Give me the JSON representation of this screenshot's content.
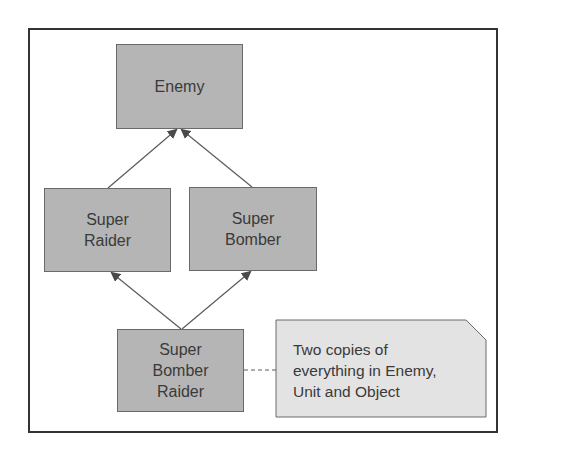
{
  "diagram": {
    "nodes": [
      {
        "id": "enemy",
        "label": "Enemy"
      },
      {
        "id": "super-raider",
        "label": "Super\nRaider"
      },
      {
        "id": "super-bomber",
        "label": "Super\nBomber"
      },
      {
        "id": "super-bomber-raider",
        "label": "Super\nBomber\nRaider"
      }
    ],
    "edges": [
      {
        "from": "super-raider",
        "to": "enemy",
        "type": "inheritance-arrow"
      },
      {
        "from": "super-bomber",
        "to": "enemy",
        "type": "inheritance-arrow"
      },
      {
        "from": "super-bomber-raider",
        "to": "super-raider",
        "type": "inheritance-arrow"
      },
      {
        "from": "super-bomber-raider",
        "to": "super-bomber",
        "type": "inheritance-arrow"
      },
      {
        "from": "super-bomber-raider",
        "to": "note",
        "type": "dashed-annotation"
      }
    ],
    "note": {
      "text": "Two copies of\neverything in Enemy,\nUnit and Object"
    },
    "colors": {
      "node_fill": "#b5b5b5",
      "note_fill": "#e3e3e3",
      "line": "#5a5a5a",
      "frame": "#333333",
      "text": "#3a3a3a"
    }
  }
}
